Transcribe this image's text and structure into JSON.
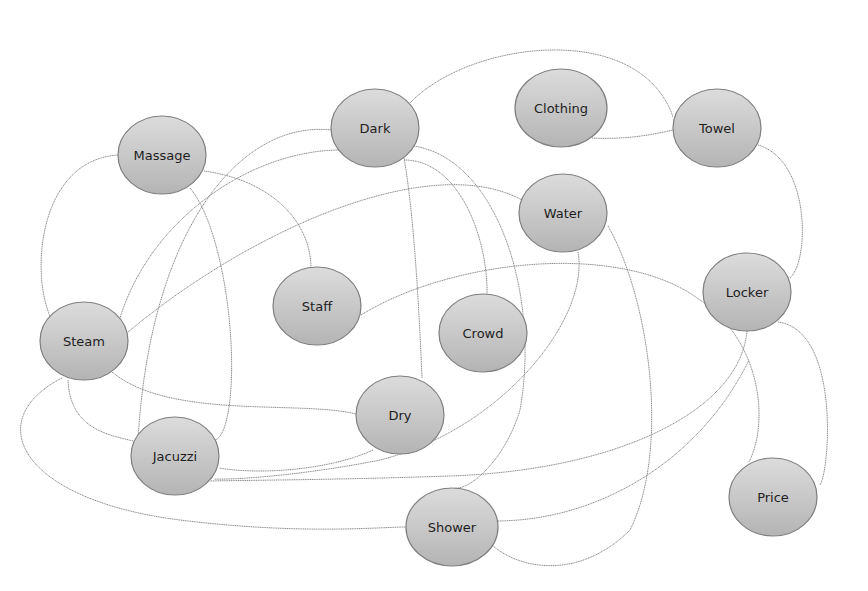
{
  "diagram": {
    "type": "concept-network",
    "node_fill_top": "#dcdcdc",
    "node_fill_bottom": "#b4b4b4",
    "node_stroke": "#7e7e7e",
    "edge_color": "#8a8a8a",
    "nodes": [
      {
        "id": "massage",
        "label": "Massage",
        "cx": 162,
        "cy": 155,
        "rx": 44,
        "ry": 39
      },
      {
        "id": "dark",
        "label": "Dark",
        "cx": 375,
        "cy": 128,
        "rx": 44,
        "ry": 39
      },
      {
        "id": "clothing",
        "label": "Clothing",
        "cx": 561,
        "cy": 108,
        "rx": 46,
        "ry": 39
      },
      {
        "id": "towel",
        "label": "Towel",
        "cx": 717,
        "cy": 128,
        "rx": 44,
        "ry": 39
      },
      {
        "id": "water",
        "label": "Water",
        "cx": 563,
        "cy": 213,
        "rx": 44,
        "ry": 39
      },
      {
        "id": "staff",
        "label": "Staff",
        "cx": 317,
        "cy": 306,
        "rx": 44,
        "ry": 39
      },
      {
        "id": "locker",
        "label": "Locker",
        "cx": 747,
        "cy": 292,
        "rx": 44,
        "ry": 39
      },
      {
        "id": "steam",
        "label": "Steam",
        "cx": 84,
        "cy": 341,
        "rx": 44,
        "ry": 39
      },
      {
        "id": "crowd",
        "label": "Crowd",
        "cx": 483,
        "cy": 333,
        "rx": 44,
        "ry": 39
      },
      {
        "id": "dry",
        "label": "Dry",
        "cx": 400,
        "cy": 415,
        "rx": 44,
        "ry": 39
      },
      {
        "id": "jacuzzi",
        "label": "Jacuzzi",
        "cx": 175,
        "cy": 456,
        "rx": 44,
        "ry": 39
      },
      {
        "id": "price",
        "label": "Price",
        "cx": 773,
        "cy": 497,
        "rx": 44,
        "ry": 39
      },
      {
        "id": "shower",
        "label": "Shower",
        "cx": 452,
        "cy": 527,
        "rx": 46,
        "ry": 39
      }
    ],
    "edges": [
      {
        "from": "steam",
        "to": "massage",
        "path": "M50,316 C30,270 40,160 118,155"
      },
      {
        "from": "massage",
        "to": "staff",
        "path": "M204,171 C270,180 310,220 311,267"
      },
      {
        "from": "massage",
        "to": "jacuzzi",
        "path": "M190,188 C225,230 240,360 227,418 C222,440 215,440 214,440"
      },
      {
        "from": "dark",
        "to": "towel",
        "path": "M410,103 C470,40 640,20 673,117"
      },
      {
        "from": "dark",
        "to": "jacuzzi",
        "path": "M331,130 C240,120 150,230 138,440"
      },
      {
        "from": "dark",
        "to": "steam",
        "path": "M341,150 C250,150 150,220 120,318"
      },
      {
        "from": "dark",
        "to": "dry",
        "path": "M404,158 C415,220 420,330 422,378"
      },
      {
        "from": "dark",
        "to": "crowd",
        "path": "M404,160 C460,160 488,240 487,294"
      },
      {
        "from": "dark",
        "to": "shower",
        "path": "M414,146 C500,160 540,300 520,410 C505,460 470,490 455,488"
      },
      {
        "from": "clothing",
        "to": "towel",
        "path": "M592,138 C630,140 660,133 673,130"
      },
      {
        "from": "towel",
        "to": "locker",
        "path": "M758,145 C810,160 810,260 790,278"
      },
      {
        "from": "steam",
        "to": "water",
        "path": "M128,332 C250,230 430,150 522,200"
      },
      {
        "from": "steam",
        "to": "dry",
        "path": "M112,372 C170,420 300,400 356,414"
      },
      {
        "from": "steam",
        "to": "jacuzzi",
        "path": "M68,380 C70,430 110,435 133,441"
      },
      {
        "from": "steam",
        "to": "shower",
        "path": "M62,378 C-20,420 20,500 180,520 C300,535 380,527 406,527"
      },
      {
        "from": "staff",
        "to": "price",
        "path": "M361,315 C450,260 620,240 700,300 C760,340 770,420 749,462"
      },
      {
        "from": "locker",
        "to": "price",
        "path": "M778,322 C840,330 830,470 820,485"
      },
      {
        "from": "locker",
        "to": "jacuzzi",
        "path": "M747,331 C740,410 620,470 450,476 C330,480 260,480 210,481"
      },
      {
        "from": "water",
        "to": "jacuzzi",
        "path": "M578,252 C590,320 500,430 380,460 C300,476 230,480 214,479"
      },
      {
        "from": "water",
        "to": "shower",
        "path": "M608,226 C650,300 670,450 630,530 C580,580 520,570 492,545"
      },
      {
        "from": "dry",
        "to": "jacuzzi",
        "path": "M373,450 C330,470 260,475 219,468"
      },
      {
        "from": "shower",
        "to": "locker",
        "path": "M498,521 C600,520 700,460 749,360"
      }
    ]
  }
}
